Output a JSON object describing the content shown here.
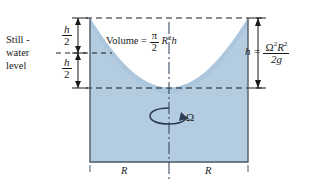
{
  "figure": {
    "colors": {
      "water_fill": "#b4cce0",
      "outline": "#4a5a66",
      "line": "#1a1a1a",
      "axis": "#2b3a52"
    }
  },
  "labels": {
    "still_water": {
      "line1": "Still -",
      "line2": "water",
      "line3": "level"
    },
    "half_height_upper": {
      "num": "h",
      "den": "2"
    },
    "half_height_lower": {
      "num": "h",
      "den": "2"
    },
    "volume": {
      "text": "Volume =",
      "num": "π",
      "den": "2",
      "tail_base": "R",
      "tail_exp": "2",
      "tail_h": "h"
    },
    "height_eq": {
      "lhs": "h =",
      "num_omega": "Ω",
      "num_omega_exp": "2",
      "num_r": "R",
      "num_r_exp": "2",
      "den": "2g"
    },
    "omega_axis": "Ω",
    "radius_left": "R",
    "radius_right": "R"
  },
  "geometry": {
    "container": {
      "left": 90,
      "right": 248,
      "top": 18,
      "bottom": 162
    },
    "still_water_level_y": 53,
    "paraboloid_vertex_y": 88,
    "paraboloid_rim_y": 18,
    "axis_x": 169,
    "dim_line_left_x": 78,
    "dim_line_right_x": 258
  }
}
